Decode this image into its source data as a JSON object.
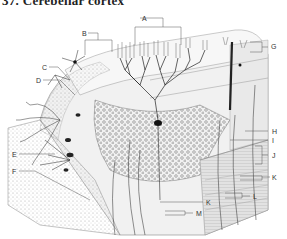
{
  "title": "37. Cerebellar cortex",
  "labels": {
    "A": "A",
    "B": "B",
    "C": "C",
    "D": "D",
    "E": "E",
    "F": "F",
    "G": "G",
    "H": "H",
    "I": "I",
    "J": "J",
    "K1": "K",
    "K2": "K",
    "L": "L",
    "M": "M"
  }
}
